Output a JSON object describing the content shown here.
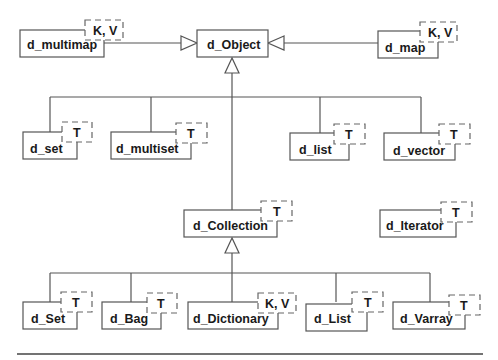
{
  "diagram": {
    "type": "class-hierarchy",
    "root": "d_Object",
    "classes": [
      {
        "id": "multimap",
        "name": "d_multimap",
        "template": "K, V",
        "parent": "d_Object"
      },
      {
        "id": "object",
        "name": "d_Object",
        "template": null,
        "parent": null
      },
      {
        "id": "map",
        "name": "d_map",
        "template": "K, V",
        "parent": "d_Object"
      },
      {
        "id": "set_l",
        "name": "d_set",
        "template": "T",
        "parent": "d_Object"
      },
      {
        "id": "multiset",
        "name": "d_multiset",
        "template": "T",
        "parent": "d_Object"
      },
      {
        "id": "list_l",
        "name": "d_list",
        "template": "T",
        "parent": "d_Object"
      },
      {
        "id": "vector",
        "name": "d_vector",
        "template": "T",
        "parent": "d_Object"
      },
      {
        "id": "collection",
        "name": "d_Collection",
        "template": "T",
        "parent": "d_Object"
      },
      {
        "id": "iterator",
        "name": "d_Iterator",
        "template": "T",
        "parent": null
      },
      {
        "id": "set_u",
        "name": "d_Set",
        "template": "T",
        "parent": "d_Collection"
      },
      {
        "id": "bag",
        "name": "d_Bag",
        "template": "T",
        "parent": "d_Collection"
      },
      {
        "id": "dictionary",
        "name": "d_Dictionary",
        "template": "K, V",
        "parent": "d_Collection"
      },
      {
        "id": "list_u",
        "name": "d_List",
        "template": "T",
        "parent": "d_Collection"
      },
      {
        "id": "varray",
        "name": "d_Varray",
        "template": "T",
        "parent": "d_Collection"
      }
    ],
    "labels": {
      "multimap": "d_multimap",
      "multimap_tpl": "K, V",
      "object": "d_Object",
      "map": "d_map",
      "map_tpl": "K, V",
      "set_l": "d_set",
      "set_l_tpl": "T",
      "multiset": "d_multiset",
      "multiset_tpl": "T",
      "list_l": "d_list",
      "list_l_tpl": "T",
      "vector": "d_vector",
      "vector_tpl": "T",
      "collection": "d_Collection",
      "collection_tpl": "T",
      "iterator": "d_Iterator",
      "iterator_tpl": "T",
      "set_u": "d_Set",
      "set_u_tpl": "T",
      "bag": "d_Bag",
      "bag_tpl": "T",
      "dictionary": "d_Dictionary",
      "dictionary_tpl": "K, V",
      "list_u": "d_List",
      "list_u_tpl": "T",
      "varray": "d_Varray",
      "varray_tpl": "T"
    },
    "colors": {
      "stroke": "#555555",
      "text": "#1a1a1a",
      "background": "#ffffff"
    }
  }
}
